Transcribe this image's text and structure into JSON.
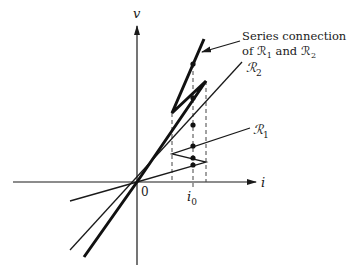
{
  "diagram": {
    "axes": {
      "x_label": "i",
      "y_label": "v",
      "origin_label": "0",
      "tick_label": "i",
      "tick_label_sub": "0"
    },
    "curves": [
      {
        "name": "R1",
        "label": "ℛ",
        "sub": "1"
      },
      {
        "name": "R2",
        "label": "ℛ",
        "sub": "2"
      },
      {
        "name": "series",
        "annotation_line1": "Series connection",
        "annotation_line2_prefix": "of ℛ",
        "annotation_sub1": "1",
        "annotation_mid": " and ℛ",
        "annotation_sub2": "2"
      }
    ],
    "colors": {
      "ink": "#1a1a1a",
      "background": "#ffffff"
    }
  }
}
